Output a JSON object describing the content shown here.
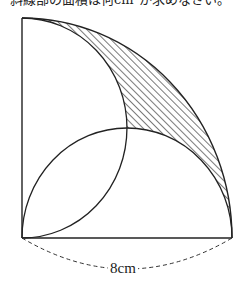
{
  "question": {
    "text": "斜線部の面積は何cm²か求めなさい。"
  },
  "figure": {
    "dimension_label": "8cm",
    "colors": {
      "stroke": "#222222",
      "hatch": "#333333",
      "background": "#ffffff"
    }
  }
}
